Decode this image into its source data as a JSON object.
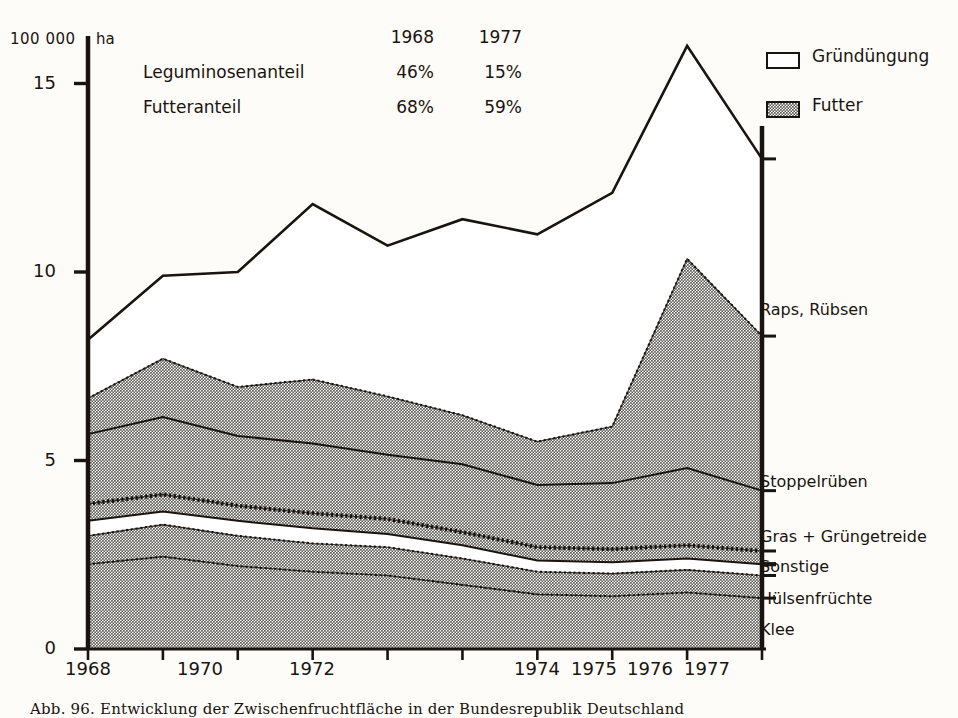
{
  "figure": {
    "unit_number": "100 000",
    "unit_symbol": "ha",
    "caption": "Abb. 96. Entwicklung der Zwischenfruchtfläche in der Bundesrepublik Deutschland"
  },
  "annotation": {
    "col_headers": [
      "1968",
      "1977"
    ],
    "rows": [
      {
        "label": "Leguminosenanteil",
        "v1968": "46%",
        "v1977": "15%"
      },
      {
        "label": "Futteranteil",
        "v1968": "68%",
        "v1977": "59%"
      }
    ]
  },
  "legend": {
    "items": [
      {
        "label": "Gründüngung",
        "swatch": "open"
      },
      {
        "label": "Futter",
        "swatch": "stipple"
      }
    ]
  },
  "series_labels": [
    {
      "name": "Raps, Rübsen"
    },
    {
      "name": "Stoppelrüben"
    },
    {
      "name": "Gras + Grüngetreide"
    },
    {
      "name": "Sonstige"
    },
    {
      "name": "Hülsenfrüchte"
    },
    {
      "name": "Klee"
    }
  ],
  "colors": {
    "ink": "#1a1410",
    "paper": "#fdfcf8",
    "futter_fill": "#9a9a97",
    "gruenduengung_fill": "#ffffff"
  },
  "chart_data": {
    "type": "area",
    "title": "Entwicklung der Zwischenfruchtfläche in der Bundesrepublik Deutschland",
    "xlabel": "",
    "ylabel": "100 000 ha",
    "xlim": [
      1968,
      1977
    ],
    "ylim": [
      0,
      16.5
    ],
    "yticks": [
      0,
      5,
      10,
      15
    ],
    "ytick_labels": [
      "0",
      "5",
      "10",
      "15"
    ],
    "xticks": [
      1968,
      1969,
      1970,
      1971,
      1972,
      1973,
      1974,
      1975,
      1976,
      1977
    ],
    "xtick_labels": [
      "1968",
      "",
      "1970",
      "",
      "1972",
      "",
      "1974",
      "1975",
      "1976",
      "1977"
    ],
    "grid": false,
    "legend_position": "top-right",
    "stacking": "cumulative from bottom",
    "x": [
      1968,
      1969,
      1970,
      1971,
      1972,
      1973,
      1974,
      1975,
      1976,
      1977
    ],
    "series": [
      {
        "name": "Klee",
        "fill": "futter",
        "values": [
          2.25,
          2.45,
          2.2,
          2.05,
          1.95,
          1.7,
          1.45,
          1.4,
          1.5,
          1.35
        ]
      },
      {
        "name": "Hülsenfrüchte",
        "fill": "futter",
        "values": [
          0.75,
          0.85,
          0.8,
          0.75,
          0.75,
          0.7,
          0.6,
          0.6,
          0.6,
          0.6
        ]
      },
      {
        "name": "Sonstige",
        "fill": "gruenduengung",
        "values": [
          0.4,
          0.35,
          0.4,
          0.4,
          0.35,
          0.35,
          0.3,
          0.3,
          0.3,
          0.3
        ]
      },
      {
        "name": "Gras + Grüngetreide",
        "fill": "futter",
        "values": [
          0.45,
          0.45,
          0.4,
          0.4,
          0.4,
          0.35,
          0.35,
          0.35,
          0.35,
          0.35
        ]
      },
      {
        "name": "Stoppelrüben",
        "fill": "futter",
        "values": [
          1.85,
          2.05,
          1.85,
          1.85,
          1.7,
          1.8,
          1.65,
          1.75,
          2.05,
          1.6
        ]
      },
      {
        "name": "Raps, Rübsen",
        "fill": "futter",
        "values": [
          0.95,
          1.55,
          1.3,
          1.7,
          1.55,
          1.3,
          1.15,
          1.5,
          5.55,
          4.1
        ]
      },
      {
        "name": "Gründüngung (Rest)",
        "fill": "gruenduengung",
        "values": [
          1.55,
          2.2,
          3.05,
          4.65,
          4.0,
          5.2,
          5.5,
          4.9,
          5.65,
          4.7
        ]
      }
    ],
    "cumulative_tops": {
      "klee": [
        2.25,
        2.45,
        2.2,
        2.05,
        1.95,
        1.7,
        1.45,
        1.4,
        1.5,
        1.35
      ],
      "huelsenfruechte": [
        3.0,
        3.3,
        3.0,
        2.8,
        2.7,
        2.4,
        2.05,
        2.0,
        2.1,
        1.95
      ],
      "sonstige": [
        3.4,
        3.65,
        3.4,
        3.2,
        3.05,
        2.75,
        2.35,
        2.3,
        2.4,
        2.25
      ],
      "gras_gruengetreide": [
        3.85,
        4.1,
        3.8,
        3.6,
        3.45,
        3.1,
        2.7,
        2.65,
        2.75,
        2.6
      ],
      "stoppelrueben": [
        5.7,
        6.15,
        5.65,
        5.45,
        5.15,
        4.9,
        4.35,
        4.4,
        4.8,
        4.2
      ],
      "raps_ruebsen_futter": [
        6.65,
        7.7,
        6.95,
        7.15,
        6.7,
        6.2,
        5.5,
        5.9,
        10.35,
        8.3
      ],
      "gesamt": [
        8.2,
        9.9,
        10.0,
        11.8,
        10.7,
        11.4,
        11.0,
        12.1,
        16.0,
        13.0
      ]
    }
  }
}
